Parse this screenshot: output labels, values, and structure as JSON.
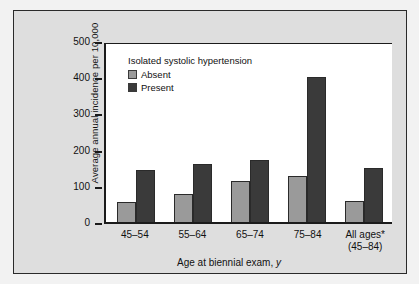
{
  "chart_data": {
    "type": "bar",
    "title": "",
    "xlabel": "Age at biennial exam, y",
    "ylabel": "Average annual incidence per 10,000",
    "ylim": [
      0,
      500
    ],
    "yticks": [
      "0",
      "100",
      "200",
      "300",
      "400",
      "500"
    ],
    "grid": false,
    "legend": {
      "title": "Isolated systolic hypertension",
      "position": "top-left-inside",
      "entries": [
        {
          "name": "Absent",
          "color": "#9a9a9a"
        },
        {
          "name": "Present",
          "color": "#3a3a3a"
        }
      ]
    },
    "categories": [
      "45–54",
      "55–64",
      "65–74",
      "75–84",
      "All ages*"
    ],
    "category_sublabels": [
      "",
      "",
      "",
      "",
      "(45–84)"
    ],
    "series": [
      {
        "name": "Absent",
        "color": "#9a9a9a",
        "values": [
          55,
          78,
          113,
          128,
          58
        ]
      },
      {
        "name": "Present",
        "color": "#3a3a3a",
        "values": [
          145,
          160,
          170,
          400,
          148
        ]
      }
    ],
    "footnote_marker": "*"
  },
  "axis": {
    "y_title": "Average annual incidence per 10,000",
    "x_title_plain": "Age at biennial exam, ",
    "x_title_italic": "y"
  },
  "colors": {
    "page_background": "#f2f2f2",
    "card_background": "#dedede",
    "plot_background": "#ffffff",
    "frame": "#2a2a2a",
    "axis": "#1b1b1b",
    "absent": "#9a9a9a",
    "present": "#3a3a3a"
  }
}
